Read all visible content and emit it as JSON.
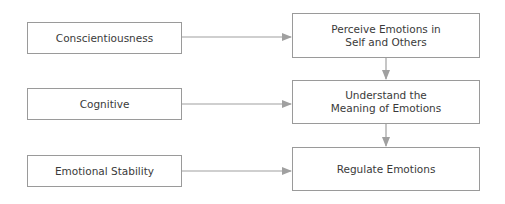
{
  "diagram": {
    "left_nodes": [
      {
        "label": "Conscientiousness"
      },
      {
        "label": "Cognitive"
      },
      {
        "label": "Emotional Stability"
      }
    ],
    "right_nodes": [
      {
        "label": "Perceive Emotions in Self and Others"
      },
      {
        "label": "Understand the Meaning of Emotions"
      },
      {
        "label": "Regulate Emotions"
      }
    ],
    "edges": [
      {
        "from": "Conscientiousness",
        "to": "Perceive Emotions in Self and Others"
      },
      {
        "from": "Cognitive",
        "to": "Understand the Meaning of Emotions"
      },
      {
        "from": "Emotional Stability",
        "to": "Regulate Emotions"
      },
      {
        "from": "Perceive Emotions in Self and Others",
        "to": "Understand the Meaning of Emotions"
      },
      {
        "from": "Understand the Meaning of Emotions",
        "to": "Regulate Emotions"
      }
    ],
    "colors": {
      "border": "#9a9a9a",
      "arrow": "#a0a0a0",
      "text": "#3a3a3a"
    }
  }
}
